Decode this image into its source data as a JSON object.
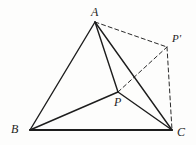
{
  "figure": {
    "background_color": "#fdfdfc",
    "stroke_color": "#1d1d1d",
    "labels": {
      "a": "A",
      "b": "B",
      "c": "C",
      "p": "P",
      "p_prime": "P'"
    },
    "points": {
      "a": {
        "name": "A",
        "x": 95,
        "y": 22
      },
      "b": {
        "name": "B",
        "x": 30,
        "y": 130
      },
      "c": {
        "name": "C",
        "x": 172,
        "y": 130
      },
      "p": {
        "name": "P",
        "x": 118,
        "y": 92
      },
      "p_prime": {
        "name": "P'",
        "x": 167,
        "y": 47
      }
    },
    "solid_segments": [
      {
        "name": "AB",
        "from": "A",
        "to": "B",
        "width": 1.4
      },
      {
        "name": "BC",
        "from": "B",
        "to": "C",
        "width": 2.2
      },
      {
        "name": "AC",
        "from": "A",
        "to": "C",
        "width": 1.4
      },
      {
        "name": "AP",
        "from": "A",
        "to": "P",
        "width": 1.4
      },
      {
        "name": "BP",
        "from": "B",
        "to": "P",
        "width": 1.4
      },
      {
        "name": "PC",
        "from": "P",
        "to": "C",
        "width": 1.4
      }
    ],
    "dashed_segments": [
      {
        "name": "AP'",
        "from": "A",
        "to": "P'",
        "width": 1.0
      },
      {
        "name": "PP'",
        "from": "P",
        "to": "P'",
        "width": 1.0
      },
      {
        "name": "P'C",
        "from": "P'",
        "to": "C",
        "width": 1.0
      }
    ]
  }
}
